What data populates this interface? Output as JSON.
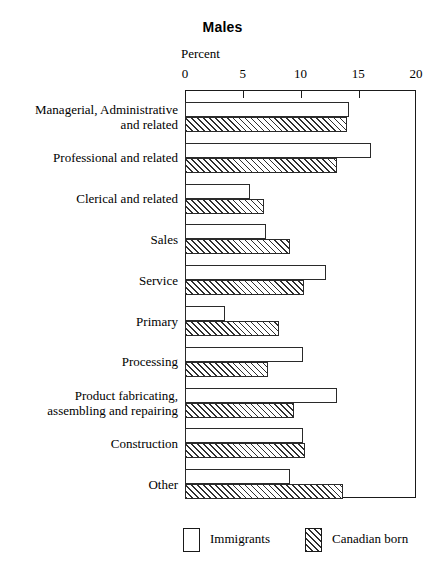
{
  "chart_data": {
    "type": "bar",
    "orientation": "horizontal",
    "title": "Males",
    "xlabel": "Percent",
    "ylabel": "",
    "xlim": [
      0,
      20
    ],
    "xticks": [
      0,
      5,
      10,
      15,
      20
    ],
    "xtick_labels": [
      "0",
      "5",
      "10",
      "15",
      "20"
    ],
    "grid": false,
    "legend_position": "bottom",
    "categories": [
      "Managerial, Administrative and related",
      "Professional and related",
      "Clerical and related",
      "Sales",
      "Service",
      "Primary",
      "Processing",
      "Product fabricating, assembling and repairing",
      "Construction",
      "Other"
    ],
    "category_lines": [
      [
        "Managerial, Administrative",
        "and related"
      ],
      [
        "Professional and related"
      ],
      [
        "Clerical and related"
      ],
      [
        "Sales"
      ],
      [
        "Service"
      ],
      [
        "Primary"
      ],
      [
        "Processing"
      ],
      [
        "Product fabricating,",
        "assembling and repairing"
      ],
      [
        "Construction"
      ],
      [
        "Other"
      ]
    ],
    "series": [
      {
        "name": "Immigrants",
        "fill": "solid-white",
        "values": [
          14.2,
          16.1,
          5.6,
          7.0,
          12.2,
          3.5,
          10.2,
          13.2,
          10.2,
          9.1
        ]
      },
      {
        "name": "Canadian born",
        "fill": "diagonal-hatch",
        "values": [
          14.0,
          13.2,
          6.8,
          9.1,
          10.3,
          8.1,
          7.2,
          9.4,
          10.4,
          13.7
        ]
      }
    ]
  },
  "legend": {
    "items": [
      {
        "label": "Immigrants",
        "style": "solid-white"
      },
      {
        "label": "Canadian born",
        "style": "diagonal-hatch"
      }
    ]
  }
}
